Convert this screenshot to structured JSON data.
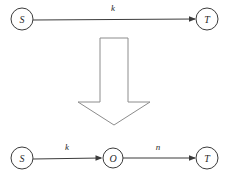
{
  "diagram": {
    "background_color": "#ffffff",
    "stroke_color": "#3b3b3b",
    "block_arrow_color": "#8c8c8c",
    "top_row": {
      "name": "before-graph",
      "nodes": [
        {
          "id": "top-s",
          "label": "S",
          "cx": 22,
          "cy": 19,
          "r": 11
        },
        {
          "id": "top-t",
          "label": "T",
          "cx": 207,
          "cy": 19,
          "r": 11
        }
      ],
      "edges": [
        {
          "id": "top-edge-k",
          "label": "k",
          "from": "S",
          "to": "T",
          "label_x": 113,
          "label_y": 11,
          "x1": 33,
          "y1": 20,
          "x2": 195,
          "y2": 19
        }
      ]
    },
    "transform_arrow": {
      "name": "downward-block-arrow",
      "direction": "down",
      "points": "100,38 128,38 128,102 150,102 114,125 78,102 100,102"
    },
    "bottom_row": {
      "name": "after-graph",
      "nodes": [
        {
          "id": "bottom-s",
          "label": "S",
          "cx": 22,
          "cy": 158,
          "r": 11
        },
        {
          "id": "bottom-o",
          "label": "O",
          "cx": 113,
          "cy": 158,
          "r": 10
        },
        {
          "id": "bottom-t",
          "label": "T",
          "cx": 207,
          "cy": 158,
          "r": 11
        }
      ],
      "edges": [
        {
          "id": "bottom-edge-k",
          "label": "k",
          "from": "S",
          "to": "O",
          "label_x": 67,
          "label_y": 150,
          "x1": 33,
          "y1": 159,
          "x2": 101,
          "y2": 158
        },
        {
          "id": "bottom-edge-n",
          "label": "n",
          "from": "O",
          "to": "T",
          "label_x": 158,
          "label_y": 150,
          "x1": 123,
          "y1": 158,
          "x2": 195,
          "y2": 158
        }
      ]
    }
  }
}
